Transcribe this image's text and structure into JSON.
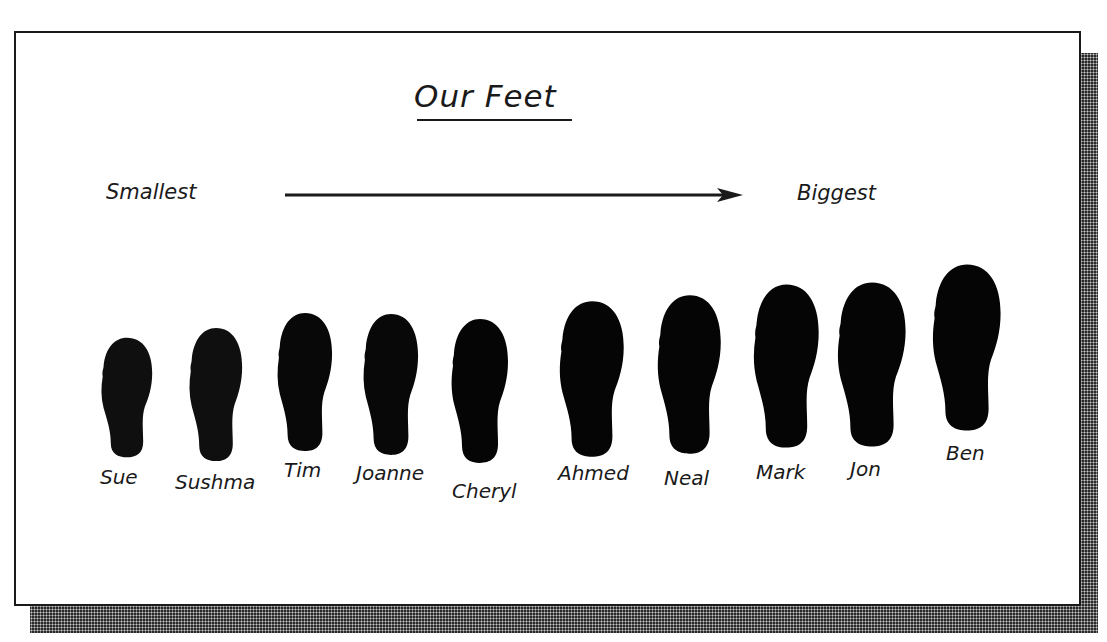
{
  "title": "Our Feet",
  "scale": {
    "start_label": "Smallest",
    "end_label": "Biggest",
    "direction": "left-to-right"
  },
  "colors": {
    "ink": "#1a1a1a",
    "footprint": "#0a0a0a",
    "background": "#ffffff"
  },
  "footprints": [
    {
      "name": "Sue",
      "order": 1
    },
    {
      "name": "Sushma",
      "order": 2
    },
    {
      "name": "Tim",
      "order": 3
    },
    {
      "name": "Joanne",
      "order": 4
    },
    {
      "name": "Cheryl",
      "order": 5
    },
    {
      "name": "Ahmed",
      "order": 6
    },
    {
      "name": "Neal",
      "order": 7
    },
    {
      "name": "Mark",
      "order": 8
    },
    {
      "name": "Jon",
      "order": 9
    },
    {
      "name": "Ben",
      "order": 10
    }
  ]
}
